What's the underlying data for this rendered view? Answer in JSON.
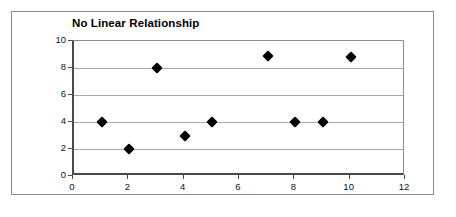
{
  "chart_data": {
    "type": "scatter",
    "title": "No Linear Relationship",
    "xlabel": "",
    "ylabel": "",
    "xlim": [
      0,
      12
    ],
    "ylim": [
      0,
      10
    ],
    "x_ticks": [
      "0",
      "2",
      "4",
      "6",
      "8",
      "10",
      "12"
    ],
    "y_ticks": [
      "0",
      "2",
      "4",
      "6",
      "8",
      "10"
    ],
    "x_tick_values": [
      0,
      2,
      4,
      6,
      8,
      10,
      12
    ],
    "y_tick_values": [
      0,
      2,
      4,
      6,
      8,
      10
    ],
    "grid": "horizontal",
    "legend": "none",
    "marker": "black-diamond",
    "points": [
      {
        "x": 1,
        "y": 4
      },
      {
        "x": 2,
        "y": 2
      },
      {
        "x": 3,
        "y": 8
      },
      {
        "x": 4,
        "y": 3
      },
      {
        "x": 5,
        "y": 4
      },
      {
        "x": 7,
        "y": 8.9
      },
      {
        "x": 8,
        "y": 4
      },
      {
        "x": 9,
        "y": 4
      },
      {
        "x": 10,
        "y": 8.8
      }
    ],
    "series": [
      {
        "name": "",
        "x": [
          1,
          2,
          3,
          4,
          5,
          7,
          8,
          9,
          10
        ],
        "values": [
          4,
          2,
          8,
          3,
          4,
          8.9,
          4,
          4,
          8.8
        ]
      }
    ]
  },
  "style": {
    "frame_color": "#8a8a8a",
    "axis_color": "#4a4a4a",
    "gridline_color": "#a9a9a9",
    "marker_color": "#000000",
    "background": "#ffffff"
  }
}
